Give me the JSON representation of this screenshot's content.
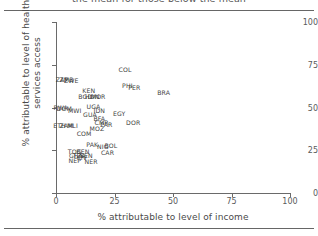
{
  "figure": {
    "heading_truncated": "the mean for those below the mean"
  },
  "chart_data": {
    "type": "scatter",
    "title": "",
    "xlabel": "% attributable to level of income",
    "ylabel": "% attributable to level of health services access",
    "xlim": [
      0,
      100
    ],
    "ylim": [
      0,
      100
    ],
    "xticks": [
      "0",
      "25",
      "50",
      "75",
      "100"
    ],
    "yticks": [
      "0",
      "25",
      "50",
      "75",
      "100"
    ],
    "xtick_values": [
      0,
      25,
      50,
      75,
      100
    ],
    "ytick_values": [
      0,
      25,
      50,
      75,
      100
    ],
    "grid": false,
    "legend": "none",
    "point_style": "text-label",
    "points": [
      {
        "label": "ZAF",
        "x": 2.5,
        "y": 66.5
      },
      {
        "label": "ZMB",
        "x": 4.5,
        "y": 66.5
      },
      {
        "label": "ZWE",
        "x": 6.5,
        "y": 66.0
      },
      {
        "label": "COL",
        "x": 29.5,
        "y": 72.5
      },
      {
        "label": "PHI",
        "x": 30.5,
        "y": 63.0
      },
      {
        "label": "PER",
        "x": 33.5,
        "y": 62.0
      },
      {
        "label": "BRA",
        "x": 46.0,
        "y": 59.0
      },
      {
        "label": "KEN",
        "x": 14.0,
        "y": 60.0
      },
      {
        "label": "BGD",
        "x": 12.5,
        "y": 57.0
      },
      {
        "label": "HON",
        "x": 15.5,
        "y": 57.0
      },
      {
        "label": "MOR",
        "x": 18.0,
        "y": 57.0
      },
      {
        "label": "RWA",
        "x": 2.0,
        "y": 50.5
      },
      {
        "label": "DOM",
        "x": 3.5,
        "y": 50.0
      },
      {
        "label": "MWI",
        "x": 8.0,
        "y": 48.5
      },
      {
        "label": "UGA",
        "x": 16.0,
        "y": 51.0
      },
      {
        "label": "IDN",
        "x": 18.5,
        "y": 48.5
      },
      {
        "label": "GUA",
        "x": 14.5,
        "y": 46.0
      },
      {
        "label": "EGY",
        "x": 27.0,
        "y": 46.5
      },
      {
        "label": "BFA",
        "x": 18.5,
        "y": 44.0
      },
      {
        "label": "CMR",
        "x": 19.5,
        "y": 41.5
      },
      {
        "label": "PAR",
        "x": 21.5,
        "y": 40.5
      },
      {
        "label": "DOR",
        "x": 33.0,
        "y": 41.5
      },
      {
        "label": "ETH",
        "x": 1.5,
        "y": 40.0
      },
      {
        "label": "ZAM",
        "x": 4.5,
        "y": 40.0
      },
      {
        "label": "MLI",
        "x": 7.0,
        "y": 39.5
      },
      {
        "label": "MOZ",
        "x": 17.5,
        "y": 38.0
      },
      {
        "label": "COM",
        "x": 12.0,
        "y": 35.0
      },
      {
        "label": "PAK",
        "x": 15.5,
        "y": 28.5
      },
      {
        "label": "NIG",
        "x": 20.0,
        "y": 27.5
      },
      {
        "label": "BOL",
        "x": 23.5,
        "y": 28.0
      },
      {
        "label": "TOG",
        "x": 8.0,
        "y": 24.5
      },
      {
        "label": "BEN",
        "x": 11.5,
        "y": 24.5
      },
      {
        "label": "CAR",
        "x": 22.0,
        "y": 24.0
      },
      {
        "label": "SEN",
        "x": 13.0,
        "y": 22.0
      },
      {
        "label": "GHA",
        "x": 8.5,
        "y": 22.5
      },
      {
        "label": "TZA",
        "x": 10.0,
        "y": 22.0
      },
      {
        "label": "CIV",
        "x": 11.0,
        "y": 21.0
      },
      {
        "label": "NEP",
        "x": 8.0,
        "y": 19.5
      },
      {
        "label": "NER",
        "x": 15.0,
        "y": 19.0
      }
    ]
  }
}
